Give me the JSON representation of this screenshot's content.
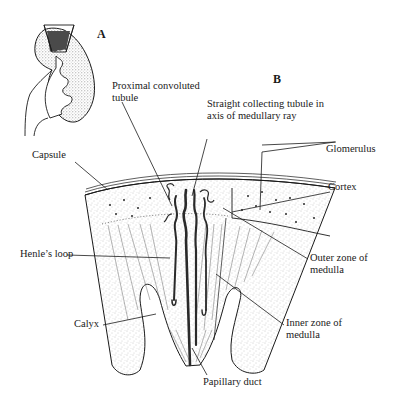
{
  "figure": {
    "panels": [
      {
        "id": "A",
        "label": "A",
        "description": "Whole kidney outline with highlighted wedge (lobe)"
      },
      {
        "id": "B",
        "label": "B",
        "description": "Enlarged section of renal lobe"
      }
    ],
    "labels": {
      "proximal_line1": "Proximal convoluted",
      "proximal_line2": "tubule",
      "straight_line1": "Straight collecting tubule in",
      "straight_line2": "axis of medullary ray",
      "glomerulus": "Glomerulus",
      "capsule": "Capsule",
      "cortex": "Cortex",
      "henle": "Henle’s loop",
      "outer_line1": "Outer zone of",
      "outer_line2": "medulla",
      "inner_line1": "Inner zone of",
      "inner_line2": "medulla",
      "calyx": "Calyx",
      "papillary": "Papillary duct"
    },
    "colors": {
      "ink": "#1a1a1a",
      "stipple": "#8a8a8a",
      "dark_wedge": "#4a4a4a",
      "background": "#ffffff"
    }
  }
}
